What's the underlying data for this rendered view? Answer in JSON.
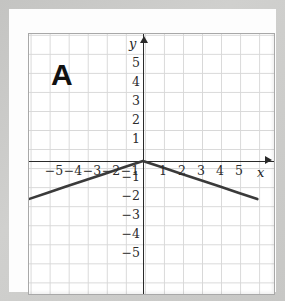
{
  "panel": {
    "label": "A"
  },
  "axes": {
    "x_name": "x",
    "y_name": "y",
    "x_ticks": [
      "−5",
      "−4",
      "−3",
      "−2",
      "−1",
      "1",
      "2",
      "3",
      "4",
      "5"
    ],
    "y_ticks": [
      "5",
      "4",
      "3",
      "2",
      "1",
      "−1",
      "−2",
      "−3",
      "−4",
      "−5"
    ]
  },
  "colors": {
    "graph_line": "#3a3a3a",
    "axis": "#2a2a2a",
    "grid": "#d8d8d8",
    "frame": "#a8a8a8",
    "page_background": "#c9c9c7",
    "card_background": "#fdfdfd",
    "plot_background": "#ffffff"
  },
  "chart_data": {
    "type": "line",
    "title": "",
    "xlabel": "x",
    "ylabel": "y",
    "xlim": [
      -6,
      6
    ],
    "ylim": [
      -6,
      6
    ],
    "grid": true,
    "legend": null,
    "annotations": [
      {
        "text": "A",
        "position": "top-left"
      }
    ],
    "series": [
      {
        "name": "y = -|x|/3",
        "points": [
          {
            "x": -6,
            "y": -2
          },
          {
            "x": -5,
            "y": -1.67
          },
          {
            "x": -4,
            "y": -1.33
          },
          {
            "x": -3,
            "y": -1
          },
          {
            "x": -2,
            "y": -0.67
          },
          {
            "x": -1,
            "y": -0.33
          },
          {
            "x": 0,
            "y": 0
          },
          {
            "x": 1,
            "y": -0.33
          },
          {
            "x": 2,
            "y": -0.67
          },
          {
            "x": 3,
            "y": -1
          },
          {
            "x": 4,
            "y": -1.33
          },
          {
            "x": 5,
            "y": -1.67
          },
          {
            "x": 6,
            "y": -2
          }
        ]
      }
    ]
  }
}
